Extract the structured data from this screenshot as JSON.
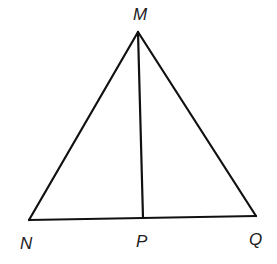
{
  "diagram": {
    "type": "triangle",
    "points": {
      "M": {
        "label": "M",
        "x": 138,
        "y": 32
      },
      "N": {
        "label": "N",
        "x": 29,
        "y": 220
      },
      "P": {
        "label": "P",
        "x": 143,
        "y": 218
      },
      "Q": {
        "label": "Q",
        "x": 256,
        "y": 216
      }
    },
    "segments": [
      [
        "M",
        "N"
      ],
      [
        "M",
        "Q"
      ],
      [
        "N",
        "Q"
      ],
      [
        "M",
        "P"
      ]
    ],
    "colors": {
      "stroke": "#111111",
      "label": "#222222",
      "background": "#ffffff"
    }
  }
}
